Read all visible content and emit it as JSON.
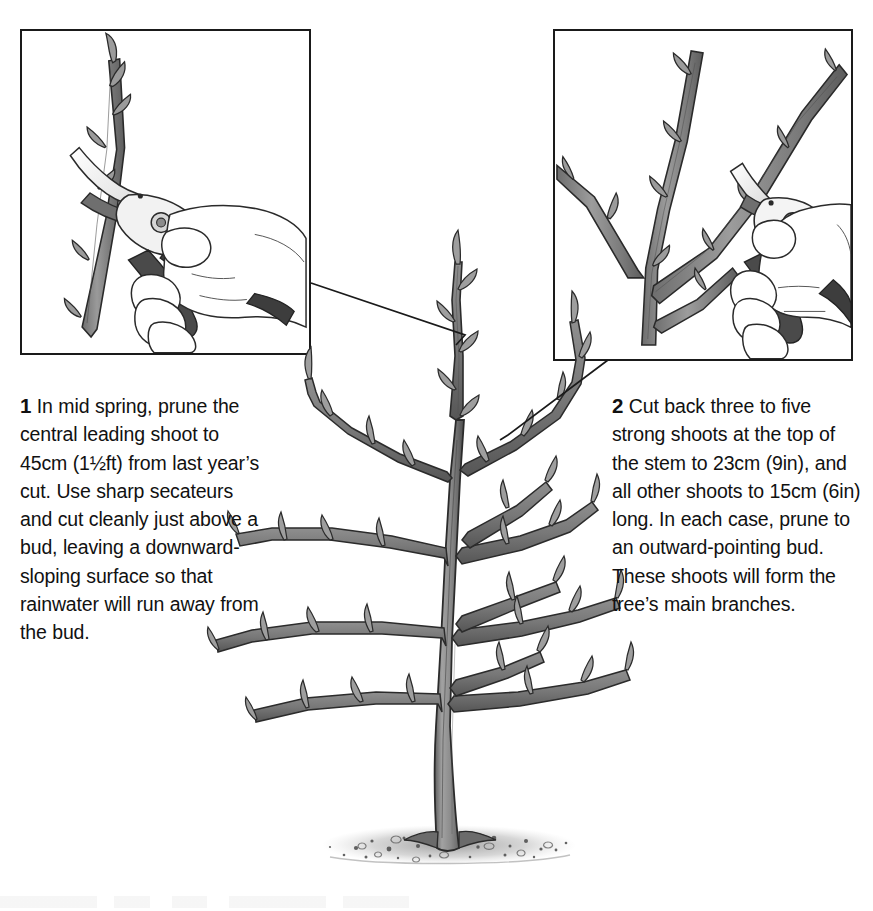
{
  "figure": {
    "kind": "horticultural-instruction-illustration",
    "background_color": "#ffffff",
    "ink_color": "#1a1a1a",
    "wood_fill_color": "#8a8a8a"
  },
  "insets": [
    {
      "id": "inset-left",
      "data_name": "inset-panel-step-1",
      "depicts": "A gloved-free hand holding secateurs making an angled cut on a vertical leading shoot just above a bud",
      "elements": [
        "vertical-shoot",
        "buds",
        "secateurs",
        "hand"
      ],
      "border_color": "#1a1a1a"
    },
    {
      "id": "inset-right",
      "data_name": "inset-panel-step-2",
      "depicts": "A hand with secateurs cutting back a side shoot on a forked stem to an outward-pointing bud",
      "elements": [
        "forked-stem",
        "side-shoots",
        "buds",
        "secateurs",
        "hand"
      ],
      "border_color": "#1a1a1a"
    }
  ],
  "captions": [
    {
      "number": "1",
      "text": "In mid spring, prune the central leading shoot to 45cm (1½ft) from last year’s cut. Use sharp secateurs and cut cleanly just above a bud, leaving a downward-sloping surface so that rainwater will run away from the bud."
    },
    {
      "number": "2",
      "text": "Cut back three to five strong shoots at the top of the stem to 23cm (9in), and all other shoots to 15cm (6in) long. In each case, prune to an outward-pointing bud. These shoots will form the tree’s main branches."
    }
  ],
  "measurements": [
    {
      "label": "central leader prune length",
      "metric": "45cm",
      "imperial": "1½ft"
    },
    {
      "label": "top strong shoots prune length",
      "metric": "23cm",
      "imperial": "9in"
    },
    {
      "label": "other shoots prune length",
      "metric": "15cm",
      "imperial": "6in"
    },
    {
      "label": "number of strong shoots",
      "value": "three to five"
    }
  ],
  "central_illustration": {
    "data_name": "young-tree-illustration",
    "description": "A leafless young sapling with a straight central trunk, tiers of lateral branches bearing dormant buds, standing in a patch of stippled soil/mulch",
    "parts": [
      "trunk",
      "central-leading-shoot",
      "lateral-branches",
      "buds",
      "soil-mulch"
    ]
  },
  "leader_lines": [
    {
      "data_name": "leader-line-left",
      "from": "inset-left bottom-right corner",
      "to": "central leading shoot"
    },
    {
      "data_name": "leader-line-right",
      "from": "inset-right bottom-left corner",
      "to": "upper side shoot"
    }
  ]
}
